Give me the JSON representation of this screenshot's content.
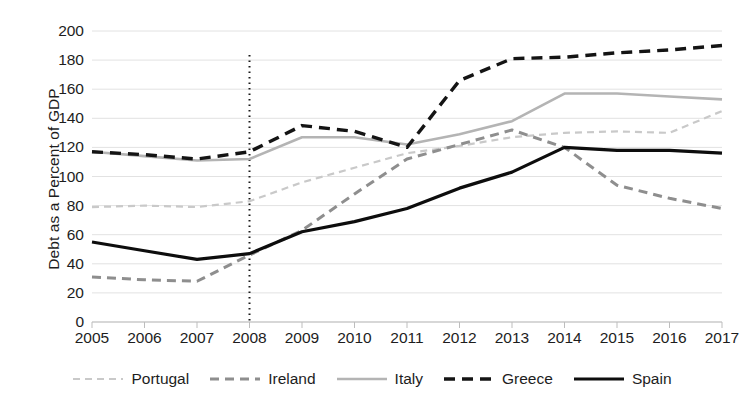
{
  "chart_data": {
    "type": "line",
    "title": "",
    "subtitle": "",
    "xlabel": "",
    "ylabel": "Debt as a Percent of GDP",
    "x": [
      2005,
      2006,
      2007,
      2008,
      2009,
      2010,
      2011,
      2012,
      2013,
      2014,
      2015,
      2016,
      2017
    ],
    "xtick_labels": [
      "2005",
      "2006",
      "2007",
      "2008",
      "2009",
      "2010",
      "2011",
      "2012",
      "2013",
      "2014",
      "2015",
      "2016",
      "2017"
    ],
    "ytick_labels": [
      "200",
      "180",
      "160",
      "140",
      "120",
      "100",
      "80",
      "60",
      "40",
      "20",
      "0"
    ],
    "yticks": [
      200,
      180,
      160,
      140,
      120,
      100,
      80,
      60,
      40,
      20,
      0
    ],
    "xlim": [
      2005,
      2017
    ],
    "ylim": [
      0,
      200
    ],
    "grid": "horizontal",
    "legend_position": "bottom",
    "annotations": [
      {
        "name": "crisis-marker-2008",
        "type": "vertical-dotted-line",
        "x": 2008,
        "color": "#1a1a1a",
        "label": ""
      }
    ],
    "series": [
      {
        "name": "Portugal",
        "color": "#c9c9c9",
        "style": "dashed",
        "width": 2.2,
        "dasharray": "7 5",
        "values": [
          79,
          80,
          79,
          83,
          96,
          106,
          116,
          121,
          127,
          130,
          131,
          130,
          145
        ]
      },
      {
        "name": "Ireland",
        "color": "#8e8e8e",
        "style": "dashed",
        "width": 3.0,
        "dasharray": "9 6",
        "values": [
          31,
          29,
          28,
          46,
          63,
          88,
          112,
          122,
          132,
          120,
          94,
          85,
          78
        ]
      },
      {
        "name": "Italy",
        "color": "#b4b4b4",
        "style": "solid",
        "width": 2.6,
        "dasharray": "",
        "values": [
          117,
          114,
          111,
          112,
          127,
          127,
          122,
          129,
          138,
          157,
          157,
          155,
          153
        ]
      },
      {
        "name": "Greece",
        "color": "#141414",
        "style": "dashed",
        "width": 3.4,
        "dasharray": "11 7",
        "values": [
          117,
          115,
          112,
          117,
          135,
          131,
          120,
          166,
          181,
          182,
          185,
          187,
          190
        ]
      },
      {
        "name": "Spain",
        "color": "#0d0d0d",
        "style": "solid",
        "width": 3.2,
        "dasharray": "",
        "values": [
          55,
          49,
          43,
          47,
          62,
          69,
          78,
          92,
          103,
          120,
          118,
          118,
          116
        ]
      }
    ]
  },
  "legend": {
    "items": [
      {
        "label": "Portugal"
      },
      {
        "label": "Ireland"
      },
      {
        "label": "Italy"
      },
      {
        "label": "Greece"
      },
      {
        "label": "Spain"
      }
    ]
  },
  "axis": {
    "y_title": "Debt as a Percent of GDP"
  },
  "colors": {
    "background": "#ffffff",
    "gridline": "#e2e2e2",
    "axis": "#bdbdbd",
    "text": "#1d1d1d"
  }
}
